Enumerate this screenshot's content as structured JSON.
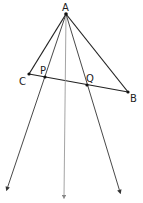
{
  "diagram": {
    "labels": {
      "A": "A",
      "B": "B",
      "C": "C",
      "P": "P",
      "Q": "Q"
    },
    "points": {
      "A": [
        66,
        14
      ],
      "B": [
        128,
        92
      ],
      "C": [
        29,
        74
      ],
      "P": [
        45,
        77
      ],
      "Q": [
        87,
        85
      ]
    },
    "rays": [
      {
        "name": "ray-through-P",
        "from": "A",
        "end": [
          7,
          189
        ],
        "color": "#333333"
      },
      {
        "name": "ray-middle",
        "from": "A",
        "end": [
          64,
          197
        ],
        "color": "#999999"
      },
      {
        "name": "ray-through-Q",
        "from": "A",
        "end": [
          120,
          192
        ],
        "color": "#333333"
      }
    ],
    "segments": [
      [
        "A",
        "C"
      ],
      [
        "A",
        "B"
      ],
      [
        "C",
        "B"
      ]
    ],
    "colors": {
      "line": "#222222",
      "gray_ray": "#9a9a9a"
    }
  }
}
